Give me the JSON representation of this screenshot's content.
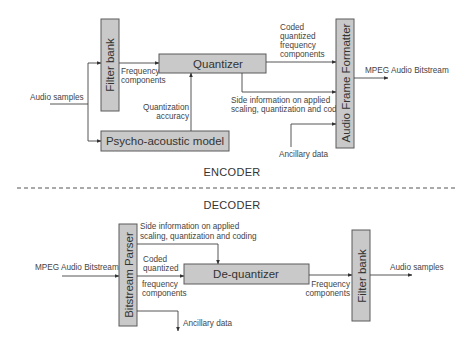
{
  "encoder": {
    "title": "ENCODER",
    "input_label": "Audio samples",
    "output_label": "MPEG Audio Bitstream",
    "blocks": {
      "filter_bank": "Filter bank",
      "quantizer": "Quantizer",
      "psycho_acoustic_model": "Psycho-acoustic model",
      "audio_frame_formatter": "Audio Frame Formatter"
    },
    "edge_labels": {
      "frequency_components": [
        "Frequency",
        "components"
      ],
      "quantization_accuracy": [
        "Quantization",
        "accuracy"
      ],
      "coded_quantized": [
        "Coded",
        "quantized",
        "frequency",
        "components"
      ],
      "side_information": [
        "Side information on applied",
        "scaling, quantization and coding"
      ],
      "ancillary_data": "Ancillary data"
    }
  },
  "decoder": {
    "title": "DECODER",
    "input_label": "MPEG Audio Bitstream",
    "output_label": "Audio samples",
    "blocks": {
      "bitstream_parser": "Bitstream Parser",
      "de_quantizer": "De-quantizer",
      "filter_bank": "Filter bank"
    },
    "edge_labels": {
      "side_information": [
        "Side information on applied",
        "scaling, quantization and coding"
      ],
      "coded_quantized": [
        "Coded",
        "quantized"
      ],
      "frequency_components_in": [
        "frequency",
        "components"
      ],
      "frequency_components_out": [
        "Frequency",
        "components"
      ],
      "ancillary_data": "Ancillary data"
    }
  },
  "colors": {
    "box_fill": "#c9c9c9",
    "box_stroke": "#5a5a5a",
    "line": "#444444",
    "text": "#333333"
  }
}
